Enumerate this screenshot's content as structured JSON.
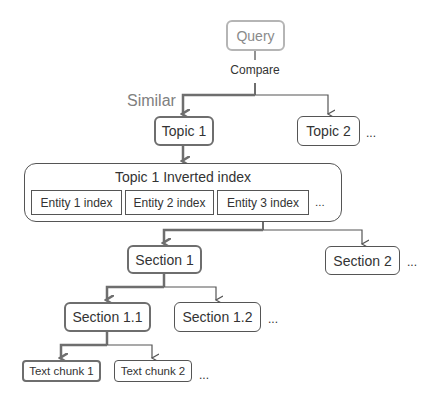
{
  "diagram": {
    "query": {
      "label": "Query"
    },
    "compare_label": "Compare",
    "similar_label": "Similar",
    "topics": [
      {
        "label": "Topic 1",
        "highlighted": true
      },
      {
        "label": "Topic 2",
        "highlighted": false
      }
    ],
    "topics_more": "...",
    "inverted_index": {
      "title": "Topic 1 Inverted index",
      "entities": [
        {
          "label": "Entity 1 index"
        },
        {
          "label": "Entity 2 index"
        },
        {
          "label": "Entity 3 index"
        }
      ],
      "more": "..."
    },
    "sections": [
      {
        "label": "Section 1",
        "highlighted": true
      },
      {
        "label": "Section 2",
        "highlighted": false
      }
    ],
    "sections_more": "...",
    "subsections": [
      {
        "label": "Section 1.1",
        "highlighted": true
      },
      {
        "label": "Section 1.2",
        "highlighted": false
      }
    ],
    "subsections_more": "...",
    "chunks": [
      {
        "label": "Text chunk 1",
        "highlighted": true
      },
      {
        "label": "Text chunk 2",
        "highlighted": false
      }
    ],
    "chunks_more": "...",
    "colors": {
      "bold_path": "#6e6e6e",
      "thin_path": "#555555",
      "query_border": "#b5b5b5",
      "similar_text": "#808080"
    }
  }
}
